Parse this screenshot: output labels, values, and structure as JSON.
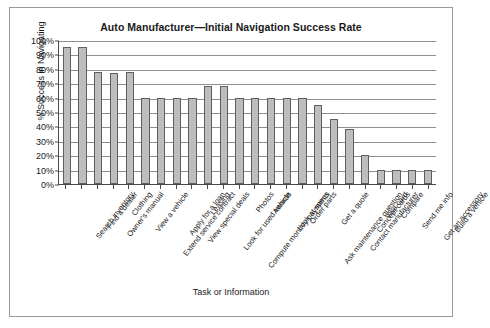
{
  "figure": {
    "title": "Auto Manufacturer—Initial Navigation Success Rate",
    "background_color": "#ffffff",
    "border_color": "#9a9a9a"
  },
  "chart_data": {
    "type": "bar",
    "title": "Auto Manufacturer—Initial Navigation Success Rate",
    "xlabel": "Task or Information",
    "ylabel": "% Success in Navigating",
    "ylim": [
      0,
      100
    ],
    "ytick_labels": [
      "100%",
      "90%",
      "80%",
      "70%",
      "60%",
      "50%",
      "40%",
      "30%",
      "20%",
      "10%",
      "0%"
    ],
    "ytick_values": [
      100,
      90,
      80,
      70,
      60,
      50,
      40,
      30,
      20,
      10,
      0
    ],
    "grid": true,
    "legend": null,
    "bar_color": "#bdbdbd",
    "bar_edge_color": "#5e5e5e",
    "categories": [
      "Search inventory",
      "Find a dealer",
      "Owner's manual",
      "Clothing",
      "View a vehicle",
      "Extend service contract",
      "Apply for a loan",
      "View special deals",
      "Leasing",
      "Look for used vehicle",
      "Compute monthly payments",
      "Photos",
      "Awards",
      "Look at specs",
      "Order parts",
      "Ask maintenance question",
      "Get a quote",
      "Contact manufacturer",
      "Concept cards",
      "Visa card",
      "Compare",
      "Send me info",
      "Get an accessory",
      "Build a vehicle"
    ],
    "values": [
      95,
      95,
      78,
      77,
      78,
      60,
      60,
      60,
      60,
      68,
      68,
      60,
      60,
      60,
      60,
      60,
      55,
      45,
      38,
      20,
      10,
      10,
      10,
      10
    ]
  }
}
